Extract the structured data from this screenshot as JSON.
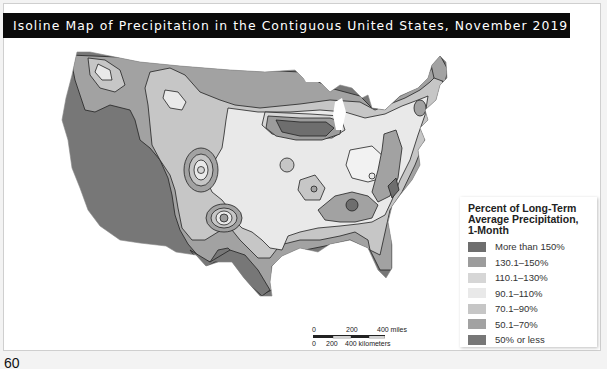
{
  "title": "Isoline Map of Precipitation in the Contiguous United States, November 2019",
  "legend": {
    "title_line1": "Percent of Long-Term",
    "title_line2": "Average Precipitation,",
    "title_line3": "1-Month",
    "items": [
      {
        "label": "More than 150%",
        "color": "#6e6e6e"
      },
      {
        "label": "130.1–150%",
        "color": "#9c9c9c"
      },
      {
        "label": "110.1–130%",
        "color": "#d6d6d6"
      },
      {
        "label": "90.1–110%",
        "color": "#e9e9e9"
      },
      {
        "label": "70.1–90%",
        "color": "#c6c6c6"
      },
      {
        "label": "50.1–70%",
        "color": "#a2a2a2"
      },
      {
        "label": "50% or less",
        "color": "#777777"
      }
    ]
  },
  "scale_bar": {
    "miles_0": "0",
    "miles_200": "200",
    "miles_400": "400 miles",
    "km_0": "0",
    "km_200": "200",
    "km_400": "400 kilometers"
  },
  "page_number": "60"
}
